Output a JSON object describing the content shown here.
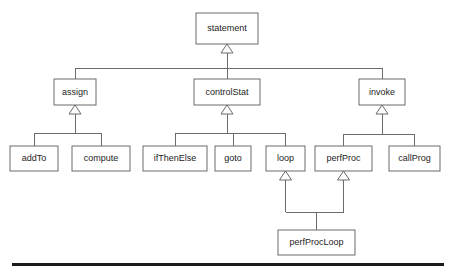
{
  "diagram": {
    "type": "uml-class-hierarchy",
    "background_color": "#ffffff",
    "box_fill_color": "#ffffff",
    "box_border_color": "#6b6b6b",
    "line_color": "#6b6b6b",
    "text_color": "#1c1c1c",
    "footer_rule_color": "#1a1a1a",
    "nodes": [
      {
        "id": "statement",
        "label": "statement",
        "x": 196,
        "y": 13,
        "w": 62,
        "h": 31
      },
      {
        "id": "assign",
        "label": "assign",
        "x": 54,
        "y": 79,
        "w": 42,
        "h": 26
      },
      {
        "id": "controlStat",
        "label": "controlStat",
        "x": 194,
        "y": 79,
        "w": 66,
        "h": 26
      },
      {
        "id": "invoke",
        "label": "invoke",
        "x": 359,
        "y": 79,
        "w": 46,
        "h": 26
      },
      {
        "id": "addTo",
        "label": "addTo",
        "x": 10,
        "y": 146,
        "w": 48,
        "h": 25
      },
      {
        "id": "compute",
        "label": "compute",
        "x": 72,
        "y": 146,
        "w": 58,
        "h": 25
      },
      {
        "id": "ifThenElse",
        "label": "ifThenElse",
        "x": 143,
        "y": 146,
        "w": 64,
        "h": 25
      },
      {
        "id": "goto",
        "label": "goto",
        "x": 215,
        "y": 146,
        "w": 36,
        "h": 25
      },
      {
        "id": "loop",
        "label": "loop",
        "x": 266,
        "y": 146,
        "w": 39,
        "h": 25
      },
      {
        "id": "perfProc",
        "label": "perfProc",
        "x": 315,
        "y": 146,
        "w": 57,
        "h": 25
      },
      {
        "id": "callProg",
        "label": "callProg",
        "x": 389,
        "y": 146,
        "w": 51,
        "h": 25
      },
      {
        "id": "perfProcLoop",
        "label": "perfProcLoop",
        "x": 278,
        "y": 230,
        "w": 77,
        "h": 25
      }
    ],
    "generalizations": [
      {
        "child": "assign",
        "parent": "statement"
      },
      {
        "child": "controlStat",
        "parent": "statement"
      },
      {
        "child": "invoke",
        "parent": "statement"
      },
      {
        "child": "addTo",
        "parent": "assign"
      },
      {
        "child": "compute",
        "parent": "assign"
      },
      {
        "child": "ifThenElse",
        "parent": "controlStat"
      },
      {
        "child": "goto",
        "parent": "controlStat"
      },
      {
        "child": "loop",
        "parent": "controlStat"
      },
      {
        "child": "perfProc",
        "parent": "invoke"
      },
      {
        "child": "callProg",
        "parent": "invoke"
      },
      {
        "child": "perfProcLoop",
        "parent": "loop"
      },
      {
        "child": "perfProcLoop",
        "parent": "perfProc"
      }
    ],
    "groups": [
      {
        "parent": "statement",
        "bus_y": 68,
        "children": [
          "assign",
          "controlStat",
          "invoke"
        ]
      },
      {
        "parent": "assign",
        "bus_y": 133,
        "children": [
          "addTo",
          "compute"
        ]
      },
      {
        "parent": "controlStat",
        "bus_y": 133,
        "children": [
          "ifThenElse",
          "goto",
          "loop"
        ]
      },
      {
        "parent": "invoke",
        "bus_y": 134,
        "children": [
          "perfProc",
          "callProg"
        ]
      }
    ],
    "merge_group": {
      "child": "perfProcLoop",
      "bus_y": 212,
      "parents": [
        "loop",
        "perfProc"
      ]
    },
    "arrow": {
      "half_width": 6,
      "height": 9
    },
    "footer_rule": {
      "x": 12,
      "y": 263,
      "w": 432,
      "h": 3
    }
  }
}
